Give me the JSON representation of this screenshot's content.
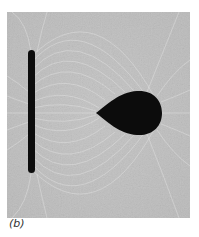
{
  "figure": {
    "caption": "(b)",
    "background_color": "#b8b8b8",
    "object_color": "#0c0c0c",
    "objects": {
      "rod": {
        "label": "charged-rod"
      },
      "teardrop": {
        "label": "teardrop-conductor"
      }
    }
  }
}
